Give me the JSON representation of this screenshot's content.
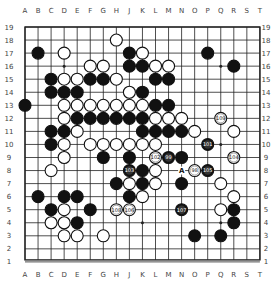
{
  "board": {
    "size": 19,
    "columns": [
      "A",
      "B",
      "C",
      "D",
      "E",
      "F",
      "G",
      "H",
      "J",
      "K",
      "L",
      "M",
      "N",
      "O",
      "P",
      "Q",
      "R",
      "S",
      "T"
    ],
    "rows": [
      19,
      18,
      17,
      16,
      15,
      14,
      13,
      12,
      11,
      10,
      9,
      8,
      7,
      6,
      5,
      4,
      3,
      2,
      1
    ],
    "colors": {
      "line": "#222222",
      "black": "#111111",
      "white": "#ffffff",
      "background": "#ffffff"
    },
    "hoshi": [
      "D16",
      "K16",
      "Q16",
      "D10",
      "K10",
      "Q10",
      "D4",
      "K4",
      "Q4"
    ],
    "stones": [
      {
        "pos": "H18",
        "color": "white"
      },
      {
        "pos": "B17",
        "color": "black"
      },
      {
        "pos": "D17",
        "color": "white"
      },
      {
        "pos": "J17",
        "color": "black"
      },
      {
        "pos": "K17",
        "color": "white"
      },
      {
        "pos": "P17",
        "color": "black"
      },
      {
        "pos": "F16",
        "color": "white"
      },
      {
        "pos": "G16",
        "color": "white"
      },
      {
        "pos": "J16",
        "color": "black"
      },
      {
        "pos": "K16",
        "color": "black"
      },
      {
        "pos": "L16",
        "color": "white"
      },
      {
        "pos": "M16",
        "color": "white"
      },
      {
        "pos": "R16",
        "color": "black"
      },
      {
        "pos": "C15",
        "color": "black"
      },
      {
        "pos": "D15",
        "color": "white"
      },
      {
        "pos": "E15",
        "color": "white"
      },
      {
        "pos": "F15",
        "color": "black"
      },
      {
        "pos": "G15",
        "color": "black"
      },
      {
        "pos": "H15",
        "color": "white"
      },
      {
        "pos": "L15",
        "color": "black"
      },
      {
        "pos": "M15",
        "color": "black"
      },
      {
        "pos": "C14",
        "color": "black"
      },
      {
        "pos": "D14",
        "color": "black"
      },
      {
        "pos": "E14",
        "color": "black"
      },
      {
        "pos": "J14",
        "color": "white"
      },
      {
        "pos": "K14",
        "color": "black"
      },
      {
        "pos": "A13",
        "color": "black"
      },
      {
        "pos": "D13",
        "color": "white"
      },
      {
        "pos": "E13",
        "color": "white"
      },
      {
        "pos": "F13",
        "color": "white"
      },
      {
        "pos": "G13",
        "color": "white"
      },
      {
        "pos": "H13",
        "color": "white"
      },
      {
        "pos": "J13",
        "color": "white"
      },
      {
        "pos": "K13",
        "color": "white"
      },
      {
        "pos": "L13",
        "color": "black"
      },
      {
        "pos": "M13",
        "color": "black"
      },
      {
        "pos": "D12",
        "color": "white"
      },
      {
        "pos": "E12",
        "color": "black"
      },
      {
        "pos": "F12",
        "color": "black"
      },
      {
        "pos": "G12",
        "color": "black"
      },
      {
        "pos": "H12",
        "color": "black"
      },
      {
        "pos": "J12",
        "color": "black"
      },
      {
        "pos": "K12",
        "color": "black"
      },
      {
        "pos": "L12",
        "color": "white"
      },
      {
        "pos": "M12",
        "color": "white"
      },
      {
        "pos": "N12",
        "color": "white"
      },
      {
        "pos": "Q12",
        "color": "white",
        "label": "109"
      },
      {
        "pos": "C11",
        "color": "black"
      },
      {
        "pos": "D11",
        "color": "black"
      },
      {
        "pos": "E11",
        "color": "white"
      },
      {
        "pos": "K11",
        "color": "black"
      },
      {
        "pos": "L11",
        "color": "black"
      },
      {
        "pos": "M11",
        "color": "black"
      },
      {
        "pos": "N11",
        "color": "black"
      },
      {
        "pos": "O11",
        "color": "white"
      },
      {
        "pos": "R11",
        "color": "white"
      },
      {
        "pos": "C10",
        "color": "black"
      },
      {
        "pos": "D10",
        "color": "white"
      },
      {
        "pos": "F10",
        "color": "white"
      },
      {
        "pos": "G10",
        "color": "white"
      },
      {
        "pos": "H10",
        "color": "white"
      },
      {
        "pos": "J10",
        "color": "white"
      },
      {
        "pos": "K10",
        "color": "white"
      },
      {
        "pos": "L10",
        "color": "white"
      },
      {
        "pos": "P10",
        "color": "black",
        "label": "101"
      },
      {
        "pos": "D9",
        "color": "white"
      },
      {
        "pos": "G9",
        "color": "black"
      },
      {
        "pos": "J9",
        "color": "black"
      },
      {
        "pos": "L9",
        "color": "white",
        "label": "102"
      },
      {
        "pos": "M9",
        "color": "black",
        "label": "99"
      },
      {
        "pos": "N9",
        "color": "black"
      },
      {
        "pos": "R9",
        "color": "white",
        "label": "104"
      },
      {
        "pos": "C8",
        "color": "white"
      },
      {
        "pos": "J8",
        "color": "black",
        "label": "103"
      },
      {
        "pos": "K8",
        "color": "black"
      },
      {
        "pos": "L8",
        "color": "white"
      },
      {
        "pos": "O8",
        "color": "white",
        "label": "98"
      },
      {
        "pos": "P8",
        "color": "black",
        "label": "105"
      },
      {
        "pos": "H7",
        "color": "black"
      },
      {
        "pos": "J7",
        "color": "white"
      },
      {
        "pos": "K7",
        "color": "black"
      },
      {
        "pos": "L7",
        "color": "white"
      },
      {
        "pos": "N7",
        "color": "black"
      },
      {
        "pos": "Q7",
        "color": "white"
      },
      {
        "pos": "B6",
        "color": "black"
      },
      {
        "pos": "D6",
        "color": "black"
      },
      {
        "pos": "E6",
        "color": "black"
      },
      {
        "pos": "J6",
        "color": "black"
      },
      {
        "pos": "K6",
        "color": "white"
      },
      {
        "pos": "R6",
        "color": "white"
      },
      {
        "pos": "C5",
        "color": "black"
      },
      {
        "pos": "D5",
        "color": "white"
      },
      {
        "pos": "F5",
        "color": "black"
      },
      {
        "pos": "H5",
        "color": "white",
        "label": "108"
      },
      {
        "pos": "J5",
        "color": "white",
        "label": "106"
      },
      {
        "pos": "N5",
        "color": "black",
        "label": "107"
      },
      {
        "pos": "Q5",
        "color": "white"
      },
      {
        "pos": "R5",
        "color": "black"
      },
      {
        "pos": "C4",
        "color": "white"
      },
      {
        "pos": "D4",
        "color": "white"
      },
      {
        "pos": "E4",
        "color": "black"
      },
      {
        "pos": "R4",
        "color": "black"
      },
      {
        "pos": "D3",
        "color": "white"
      },
      {
        "pos": "E3",
        "color": "white"
      },
      {
        "pos": "G3",
        "color": "white"
      },
      {
        "pos": "O3",
        "color": "black"
      },
      {
        "pos": "Q3",
        "color": "black"
      }
    ],
    "markers": [
      {
        "pos": "N8",
        "text": "A"
      }
    ]
  }
}
